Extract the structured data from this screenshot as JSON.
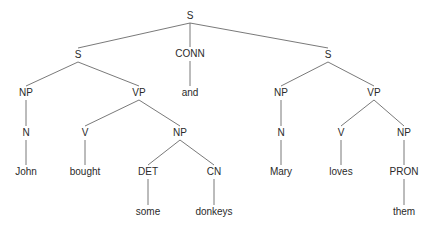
{
  "diagram": {
    "type": "parse-tree",
    "colors": {
      "text": "#2a2a2a",
      "edge": "#6a6a6a",
      "background": "#ffffff"
    },
    "nodes": [
      {
        "id": "s0",
        "label": "S",
        "x": 190,
        "y": 16
      },
      {
        "id": "s1",
        "label": "S",
        "x": 78,
        "y": 55
      },
      {
        "id": "conn",
        "label": "CONN",
        "x": 190,
        "y": 54
      },
      {
        "id": "s2",
        "label": "S",
        "x": 328,
        "y": 55
      },
      {
        "id": "np1",
        "label": "NP",
        "x": 26,
        "y": 93
      },
      {
        "id": "vp1",
        "label": "VP",
        "x": 139,
        "y": 93
      },
      {
        "id": "and",
        "label": "and",
        "x": 190,
        "y": 93
      },
      {
        "id": "np3",
        "label": "NP",
        "x": 281,
        "y": 93
      },
      {
        "id": "vp2",
        "label": "VP",
        "x": 374,
        "y": 93
      },
      {
        "id": "n1",
        "label": "N",
        "x": 26,
        "y": 133
      },
      {
        "id": "v1",
        "label": "V",
        "x": 85,
        "y": 133
      },
      {
        "id": "np2",
        "label": "NP",
        "x": 180,
        "y": 133
      },
      {
        "id": "n2",
        "label": "N",
        "x": 281,
        "y": 133
      },
      {
        "id": "v2",
        "label": "V",
        "x": 341,
        "y": 133
      },
      {
        "id": "np4",
        "label": "NP",
        "x": 404,
        "y": 133
      },
      {
        "id": "john",
        "label": "John",
        "x": 26,
        "y": 172
      },
      {
        "id": "bought",
        "label": "bought",
        "x": 85,
        "y": 172
      },
      {
        "id": "det",
        "label": "DET",
        "x": 148,
        "y": 172
      },
      {
        "id": "cn",
        "label": "CN",
        "x": 214,
        "y": 172
      },
      {
        "id": "mary",
        "label": "Mary",
        "x": 281,
        "y": 172
      },
      {
        "id": "loves",
        "label": "loves",
        "x": 341,
        "y": 172
      },
      {
        "id": "pron",
        "label": "PRON",
        "x": 404,
        "y": 172
      },
      {
        "id": "some",
        "label": "some",
        "x": 148,
        "y": 212
      },
      {
        "id": "donkeys",
        "label": "donkeys",
        "x": 214,
        "y": 212
      },
      {
        "id": "them",
        "label": "them",
        "x": 404,
        "y": 212
      }
    ],
    "edges": [
      [
        "s0",
        "s1"
      ],
      [
        "s0",
        "conn"
      ],
      [
        "s0",
        "s2"
      ],
      [
        "s1",
        "np1"
      ],
      [
        "s1",
        "vp1"
      ],
      [
        "conn",
        "and"
      ],
      [
        "s2",
        "np3"
      ],
      [
        "s2",
        "vp2"
      ],
      [
        "np1",
        "n1"
      ],
      [
        "vp1",
        "v1"
      ],
      [
        "vp1",
        "np2"
      ],
      [
        "np3",
        "n2"
      ],
      [
        "vp2",
        "v2"
      ],
      [
        "vp2",
        "np4"
      ],
      [
        "n1",
        "john"
      ],
      [
        "v1",
        "bought"
      ],
      [
        "np2",
        "det"
      ],
      [
        "np2",
        "cn"
      ],
      [
        "n2",
        "mary"
      ],
      [
        "v2",
        "loves"
      ],
      [
        "np4",
        "pron"
      ],
      [
        "det",
        "some"
      ],
      [
        "cn",
        "donkeys"
      ],
      [
        "pron",
        "them"
      ]
    ]
  }
}
